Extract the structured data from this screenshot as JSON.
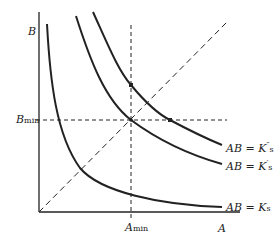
{
  "axes": {
    "y_label": "B",
    "x_label": "A",
    "y_marker_label": "B",
    "y_marker_sub": "min",
    "x_marker_label": "A",
    "x_marker_sub": "min"
  },
  "curves": [
    {
      "id": "K_s",
      "label_main": "AB = K",
      "label_sub": "s",
      "prime": ""
    },
    {
      "id": "K_s_prime",
      "label_main": "AB = K",
      "label_sub": "s",
      "prime": "′"
    },
    {
      "id": "K_s_double_prime",
      "label_main": "AB = K",
      "label_sub": "s",
      "prime": "″"
    }
  ],
  "colors": {
    "line": "#222222",
    "background": "#ffffff"
  }
}
